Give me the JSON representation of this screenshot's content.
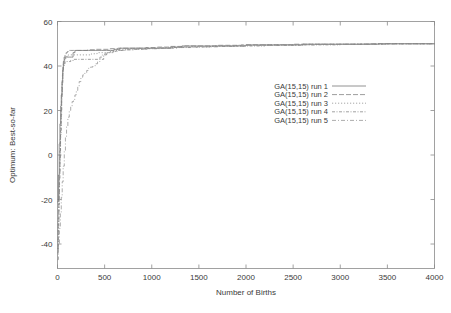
{
  "chart_data": {
    "type": "line",
    "title": "",
    "xlabel": "Number of Births",
    "ylabel": "Optimum: Best-so-far",
    "xlim": [
      0,
      4000
    ],
    "ylim": [
      -51,
      60
    ],
    "xticks": [
      0,
      500,
      1000,
      1500,
      2000,
      2500,
      3000,
      3500,
      4000
    ],
    "yticks": [
      -40,
      -20,
      0,
      20,
      40,
      60
    ],
    "xtick_labels": [
      "0",
      "500",
      "1000",
      "1500",
      "2000",
      "2500",
      "3000",
      "3500",
      "4000"
    ],
    "ytick_labels": [
      "-40",
      "-20",
      "0",
      "20",
      "40",
      "60"
    ],
    "grid": false,
    "legend_position": "center-right",
    "series": [
      {
        "name": "GA(15,15) run 1",
        "dash": "none",
        "color": "#6e6e6e",
        "points": [
          [
            0,
            -21
          ],
          [
            10,
            -9
          ],
          [
            18,
            5
          ],
          [
            26,
            14
          ],
          [
            34,
            22
          ],
          [
            40,
            27
          ],
          [
            48,
            33
          ],
          [
            55,
            38
          ],
          [
            62,
            41
          ],
          [
            70,
            43
          ],
          [
            80,
            44
          ],
          [
            95,
            44
          ],
          [
            110,
            44
          ],
          [
            130,
            44
          ],
          [
            150,
            44
          ],
          [
            165,
            46
          ],
          [
            185,
            47
          ],
          [
            210,
            47
          ],
          [
            260,
            47
          ],
          [
            330,
            47
          ],
          [
            400,
            47
          ],
          [
            470,
            47
          ],
          [
            520,
            47
          ],
          [
            560,
            47
          ],
          [
            600,
            47.5
          ],
          [
            660,
            48
          ],
          [
            720,
            48
          ],
          [
            800,
            48
          ],
          [
            900,
            48
          ],
          [
            1000,
            48
          ],
          [
            1100,
            48
          ],
          [
            1200,
            48.5
          ],
          [
            1320,
            49
          ],
          [
            1450,
            49
          ],
          [
            1600,
            49
          ],
          [
            1800,
            49
          ],
          [
            2000,
            49.5
          ],
          [
            2300,
            49.5
          ],
          [
            2600,
            49.8
          ],
          [
            3000,
            49.8
          ],
          [
            3400,
            50
          ],
          [
            3700,
            50
          ],
          [
            4000,
            50
          ]
        ]
      },
      {
        "name": "GA(15,15) run 2",
        "dash": "5,2",
        "color": "#7c7c7c",
        "points": [
          [
            0,
            -42
          ],
          [
            8,
            -30
          ],
          [
            14,
            -18
          ],
          [
            20,
            -8
          ],
          [
            26,
            2
          ],
          [
            32,
            11
          ],
          [
            38,
            20
          ],
          [
            44,
            28
          ],
          [
            50,
            34
          ],
          [
            56,
            39
          ],
          [
            62,
            42
          ],
          [
            70,
            44
          ],
          [
            80,
            45
          ],
          [
            92,
            46
          ],
          [
            105,
            46.5
          ],
          [
            120,
            47
          ],
          [
            140,
            47
          ],
          [
            170,
            47
          ],
          [
            210,
            47
          ],
          [
            260,
            47
          ],
          [
            320,
            47.3
          ],
          [
            400,
            47.5
          ],
          [
            480,
            47.5
          ],
          [
            560,
            47.8
          ],
          [
            640,
            48
          ],
          [
            720,
            48
          ],
          [
            820,
            48
          ],
          [
            940,
            48.3
          ],
          [
            1060,
            48.5
          ],
          [
            1200,
            48.8
          ],
          [
            1350,
            49
          ],
          [
            1520,
            49
          ],
          [
            1700,
            49.3
          ],
          [
            1950,
            49.5
          ],
          [
            2200,
            49.5
          ],
          [
            2500,
            49.8
          ],
          [
            2900,
            49.8
          ],
          [
            3300,
            50
          ],
          [
            3700,
            50
          ],
          [
            4000,
            50
          ]
        ]
      },
      {
        "name": "GA(15,15) run 3",
        "dash": "1.2,1.8",
        "color": "#8a8a8a",
        "points": [
          [
            0,
            -38
          ],
          [
            8,
            -26
          ],
          [
            15,
            -14
          ],
          [
            22,
            -3
          ],
          [
            28,
            7
          ],
          [
            34,
            16
          ],
          [
            40,
            24
          ],
          [
            46,
            31
          ],
          [
            52,
            36
          ],
          [
            58,
            40
          ],
          [
            66,
            42
          ],
          [
            76,
            43
          ],
          [
            88,
            44
          ],
          [
            100,
            44.5
          ],
          [
            115,
            45
          ],
          [
            135,
            45
          ],
          [
            160,
            45
          ],
          [
            200,
            45
          ],
          [
            250,
            45
          ],
          [
            300,
            45
          ],
          [
            360,
            45.5
          ],
          [
            420,
            46
          ],
          [
            460,
            46
          ],
          [
            500,
            46
          ],
          [
            540,
            47
          ],
          [
            580,
            47.3
          ],
          [
            640,
            47.5
          ],
          [
            720,
            47.8
          ],
          [
            820,
            48
          ],
          [
            940,
            48
          ],
          [
            1080,
            48.3
          ],
          [
            1240,
            48.5
          ],
          [
            1420,
            48.8
          ],
          [
            1650,
            49
          ],
          [
            1900,
            49.3
          ],
          [
            2200,
            49.5
          ],
          [
            2600,
            49.8
          ],
          [
            3000,
            49.8
          ],
          [
            3500,
            50
          ],
          [
            4000,
            50
          ]
        ]
      },
      {
        "name": "GA(15,15) run 4",
        "dash": "3,1.5,1,1.5",
        "color": "#828282",
        "points": [
          [
            0,
            -44
          ],
          [
            8,
            -33
          ],
          [
            14,
            -22
          ],
          [
            20,
            -11
          ],
          [
            26,
            -1
          ],
          [
            32,
            9
          ],
          [
            38,
            18
          ],
          [
            44,
            26
          ],
          [
            50,
            32
          ],
          [
            56,
            37
          ],
          [
            62,
            40
          ],
          [
            70,
            41
          ],
          [
            80,
            42
          ],
          [
            95,
            42
          ],
          [
            115,
            42
          ],
          [
            140,
            42.5
          ],
          [
            170,
            43
          ],
          [
            210,
            43
          ],
          [
            260,
            43
          ],
          [
            320,
            43
          ],
          [
            380,
            43
          ],
          [
            430,
            43
          ],
          [
            460,
            43
          ],
          [
            490,
            45
          ],
          [
            520,
            46
          ],
          [
            560,
            46.5
          ],
          [
            620,
            47
          ],
          [
            700,
            47.3
          ],
          [
            800,
            47.5
          ],
          [
            920,
            47.8
          ],
          [
            1060,
            48
          ],
          [
            1220,
            48.3
          ],
          [
            1400,
            48.5
          ],
          [
            1620,
            48.8
          ],
          [
            1880,
            49
          ],
          [
            2200,
            49.3
          ],
          [
            2600,
            49.5
          ],
          [
            3000,
            49.8
          ],
          [
            3500,
            50
          ],
          [
            4000,
            50
          ]
        ]
      },
      {
        "name": "GA(15,15) run 5",
        "dash": "4,2,1,2",
        "color": "#909090",
        "points": [
          [
            0,
            -47
          ],
          [
            10,
            -40
          ],
          [
            20,
            -33
          ],
          [
            30,
            -26
          ],
          [
            40,
            -19
          ],
          [
            50,
            -12
          ],
          [
            60,
            -5
          ],
          [
            72,
            2
          ],
          [
            84,
            8
          ],
          [
            96,
            13
          ],
          [
            110,
            17
          ],
          [
            125,
            20
          ],
          [
            140,
            22
          ],
          [
            155,
            24
          ],
          [
            170,
            25
          ],
          [
            185,
            27
          ],
          [
            200,
            29
          ],
          [
            215,
            31
          ],
          [
            230,
            33
          ],
          [
            248,
            35
          ],
          [
            268,
            36
          ],
          [
            290,
            37
          ],
          [
            310,
            38
          ],
          [
            330,
            39
          ],
          [
            350,
            39.5
          ],
          [
            375,
            40
          ],
          [
            400,
            41
          ],
          [
            425,
            42
          ],
          [
            450,
            44
          ],
          [
            475,
            45
          ],
          [
            500,
            45.5
          ],
          [
            540,
            46
          ],
          [
            590,
            46.5
          ],
          [
            650,
            47
          ],
          [
            730,
            47.3
          ],
          [
            830,
            47.5
          ],
          [
            950,
            47.8
          ],
          [
            1100,
            48
          ],
          [
            1280,
            48.3
          ],
          [
            1480,
            48.6
          ],
          [
            1720,
            48.9
          ],
          [
            2000,
            49.2
          ],
          [
            2350,
            49.5
          ],
          [
            2750,
            49.7
          ],
          [
            3200,
            49.9
          ],
          [
            3600,
            50
          ],
          [
            4000,
            50
          ]
        ]
      }
    ]
  },
  "legend": {
    "entries": [
      {
        "label": "GA(15,15) run 1"
      },
      {
        "label": "GA(15,15) run 2"
      },
      {
        "label": "GA(15,15) run 3"
      },
      {
        "label": "GA(15,15) run 4"
      },
      {
        "label": "GA(15,15) run 5"
      }
    ]
  }
}
